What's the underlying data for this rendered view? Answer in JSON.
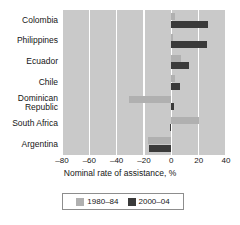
{
  "chart_data": {
    "type": "bar",
    "orientation": "horizontal",
    "title": "",
    "xlabel": "Nominal rate of assistance, %",
    "ylabel": "",
    "xlim": [
      -80,
      40
    ],
    "xticks": [
      -80,
      -60,
      -40,
      -20,
      0,
      20,
      40
    ],
    "xtick_labels": [
      "–80",
      "–60",
      "–40",
      "–20",
      "0",
      "20",
      "40"
    ],
    "grid": true,
    "grid_axis": "x",
    "legend_position": "bottom",
    "plot_background": "#c9c9c9",
    "categories": [
      "Colombia",
      "Philippines",
      "Ecuador",
      "Chile",
      "Dominican\nRepublic",
      "South Africa",
      "Argentina"
    ],
    "series": [
      {
        "name": "1980–84",
        "color": "#b0b0b0",
        "values": [
          3,
          1,
          7,
          3,
          -31,
          20,
          -17
        ]
      },
      {
        "name": "2000–04",
        "color": "#3a3a3a",
        "values": [
          27,
          26,
          13,
          6,
          2,
          -1,
          -16
        ]
      }
    ]
  },
  "legend": {
    "entries": [
      {
        "label": "1980–84",
        "swatch": "light-gray-swatch"
      },
      {
        "label": "2000–04",
        "swatch": "dark-gray-swatch"
      }
    ]
  },
  "axis": {
    "title": "Nominal rate of assistance, %"
  }
}
